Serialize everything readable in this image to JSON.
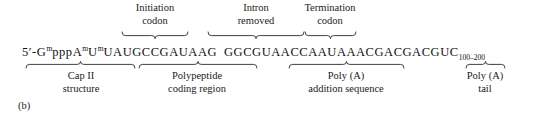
{
  "figure": {
    "panel_letter": "(b)",
    "sequence": {
      "five_prime": "5ʹ-",
      "cap_segment": [
        {
          "base": "G",
          "mod": "m"
        },
        {
          "base": "ppp",
          "mod": ""
        },
        {
          "base": "A",
          "mod": "m"
        },
        {
          "base": "U",
          "mod": "m"
        }
      ],
      "main_part_1": "UAUGCCGAUAAG",
      "gap": " ",
      "main_part_2": "GGCGUAACCAAUAAACGACGACGUC",
      "tail_subscript": "100–200",
      "full_text": "5ʹ-GmpppAmUmUAUGCCGAUAAG GGCGUAACCAAUAAACGACGACGUC100–200"
    },
    "top_annotations": [
      {
        "id": "initiation-codon",
        "line1": "Initiation",
        "line2": "codon",
        "center_x": 155,
        "brace_left": 122,
        "brace_right": 188
      },
      {
        "id": "intron-removed",
        "line1": "Intron",
        "line2": "removed",
        "center_x": 256,
        "brace_left": 208,
        "brace_right": 304
      },
      {
        "id": "termination-codon",
        "line1": "Termination",
        "line2": "codon",
        "center_x": 330,
        "brace_left": 305,
        "brace_right": 356
      }
    ],
    "bottom_annotations": [
      {
        "id": "cap-ii-structure",
        "line1": "Cap II",
        "line2": "structure",
        "center_x": 81,
        "brace_left": 26,
        "brace_right": 135
      },
      {
        "id": "polypeptide-coding-region",
        "line1": "Polypeptide",
        "line2": "coding region",
        "center_x": 197,
        "brace_left": 139,
        "brace_right": 257
      },
      {
        "id": "poly-a-addition-sequence",
        "line1": "Poly (A)",
        "line2": "addition sequence",
        "center_x": 346,
        "brace_left": 289,
        "brace_right": 404
      },
      {
        "id": "poly-a-tail",
        "line1": "Poly (A)",
        "line2": "tail",
        "center_x": 485,
        "brace_left": 466,
        "brace_right": 505
      }
    ],
    "colors": {
      "ink": "#1a1a1a",
      "background": "#ffffff",
      "brace_stroke": "#2b2b2b"
    }
  }
}
